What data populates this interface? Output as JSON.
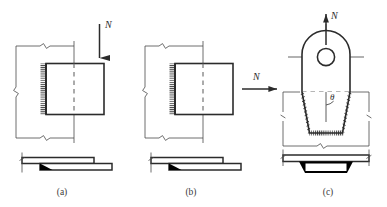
{
  "figure": {
    "title": "",
    "background_color": "#ffffff",
    "ink_color": "#3a3a3a",
    "heavy_ink_color": "#2b2b2b",
    "weld_fill_color": "#000000",
    "panels": [
      {
        "id": "a",
        "caption": "(a)",
        "load_label": "N",
        "load_direction": "down",
        "description": "square lap plate with fillet weld on left vertical edge, load applied vertically downward",
        "weld_edges": [
          "left"
        ],
        "has_centerline": true,
        "side_view": "two overlapping plates with filled fillet weld triangle"
      },
      {
        "id": "b",
        "caption": "(b)",
        "load_label": "N",
        "load_direction": "right",
        "description": "square lap plate with fillet weld on left vertical edge, load applied horizontally to the right",
        "weld_edges": [
          "left"
        ],
        "has_centerline": true,
        "side_view": "two overlapping plates with filled fillet weld triangle"
      },
      {
        "id": "c",
        "caption": "(c)",
        "load_label": "N",
        "load_direction": "up",
        "angle_label": "θ",
        "description": "lifting lug with rounded head, pin hole and tapered trapezoidal base welded to base plate, load applied vertically upward",
        "weld_edges": [
          "left-taper",
          "bottom",
          "right-taper"
        ],
        "has_centerline": true,
        "has_hole": true,
        "side_view": "base plate with filled trapezoidal weld beneath"
      }
    ],
    "dimension_lines": {
      "break_mark": "zigzag",
      "style": "thin witness lines with zigzag break marks"
    }
  }
}
